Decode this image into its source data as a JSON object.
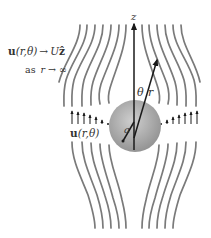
{
  "diagram": {
    "far_field": {
      "line1": "u(r,θ) → Uẑ",
      "line1_parts": {
        "u": "u",
        "args": "(r,θ)",
        "arrow": "→",
        "U": "U",
        "zhat": "ẑ"
      },
      "line2": "as r → ∞",
      "line2_parts": {
        "as": "as",
        "r": "r",
        "arrow": "→",
        "inf": "∞"
      }
    },
    "velocity_label": {
      "u": "u",
      "args": "(r,θ)"
    },
    "axis_label": "z",
    "radius_label": "r",
    "angle_label": "θ",
    "sphere_radius_label": "a",
    "colors": {
      "sphere_fill_light": "#c8c8c8",
      "sphere_fill_dark": "#8f8f8f",
      "streamline": "#7a7a7a",
      "arrow": "#1a1a1a",
      "text": "#333333",
      "background": "#ffffff"
    }
  }
}
